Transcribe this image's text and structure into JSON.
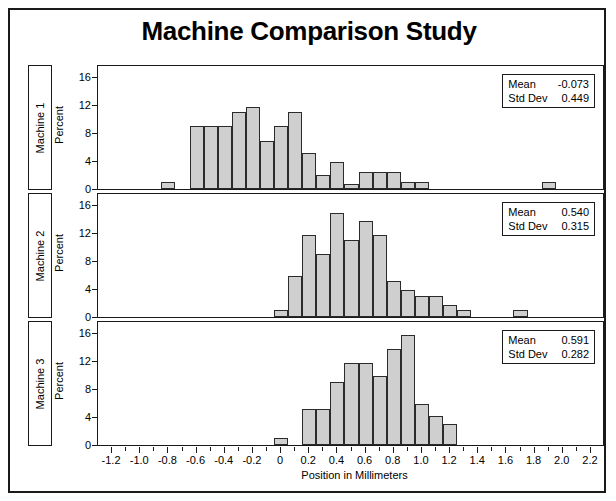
{
  "title": "Machine Comparison Study",
  "axes": {
    "x_label": "Position in Millimeters",
    "y_label": "Percent",
    "x_ticks": [
      "-1.2",
      "-1.0",
      "-0.8",
      "-0.6",
      "-0.4",
      "-0.2",
      "0",
      "0.2",
      "0.4",
      "0.6",
      "0.8",
      "1.0",
      "1.2",
      "1.4",
      "1.6",
      "1.8",
      "2.0",
      "2.2"
    ],
    "y_ticks": [
      "0",
      "4",
      "8",
      "12",
      "16"
    ]
  },
  "rows": [
    {
      "strip_label": "Machine 1",
      "mean_key": "Mean",
      "mean_value": "-0.073",
      "std_key": "Std Dev",
      "std_value": "0.449"
    },
    {
      "strip_label": "Machine 2",
      "mean_key": "Mean",
      "mean_value": "0.540",
      "std_key": "Std Dev",
      "std_value": "0.315"
    },
    {
      "strip_label": "Machine 3",
      "mean_key": "Mean",
      "mean_value": "0.591",
      "std_key": "Std Dev",
      "std_value": "0.282"
    }
  ],
  "colors": {
    "bar_fill": "#cfcfcf",
    "bar_stroke": "#2b2b2b",
    "frame": "#1a1a1a",
    "text": "#000000",
    "background": "#ffffff"
  },
  "chart_data": {
    "type": "bar",
    "title": "Machine Comparison Study",
    "xlabel": "Position in Millimeters",
    "ylabel": "Percent",
    "xlim": [
      -1.3,
      2.3
    ],
    "ylim": [
      0,
      17.5
    ],
    "grid": false,
    "legend": "none",
    "bin_width": 0.1,
    "panels": [
      {
        "name": "Machine 1",
        "mean": -0.073,
        "std_dev": 0.449,
        "bin_centers": [
          -0.8,
          -0.6,
          -0.5,
          -0.4,
          -0.3,
          -0.2,
          -0.1,
          0.0,
          0.1,
          0.2,
          0.3,
          0.4,
          0.5,
          0.6,
          0.7,
          0.8,
          0.9,
          1.0,
          1.9
        ],
        "values": [
          1.0,
          9.2,
          9.2,
          9.2,
          11.2,
          12.0,
          7.0,
          9.2,
          11.2,
          5.2,
          2.0,
          4.0,
          0.8,
          2.5,
          2.5,
          2.5,
          1.0,
          1.0,
          1.0
        ]
      },
      {
        "name": "Machine 2",
        "mean": 0.54,
        "std_dev": 0.315,
        "bin_centers": [
          0.0,
          0.1,
          0.2,
          0.3,
          0.4,
          0.5,
          0.6,
          0.7,
          0.8,
          0.9,
          1.0,
          1.1,
          1.2,
          1.3,
          1.7
        ],
        "values": [
          1.0,
          6.0,
          12.0,
          9.2,
          15.2,
          11.2,
          14.0,
          12.0,
          5.2,
          4.0,
          3.0,
          3.0,
          1.8,
          1.0,
          1.0
        ]
      },
      {
        "name": "Machine 3",
        "mean": 0.591,
        "std_dev": 0.282,
        "bin_centers": [
          0.0,
          0.2,
          0.3,
          0.4,
          0.5,
          0.6,
          0.7,
          0.8,
          0.9,
          1.0,
          1.1,
          1.2
        ],
        "values": [
          1.0,
          5.2,
          5.2,
          9.2,
          12.0,
          12.0,
          10.0,
          14.0,
          16.0,
          6.0,
          4.2,
          3.0
        ]
      }
    ]
  }
}
